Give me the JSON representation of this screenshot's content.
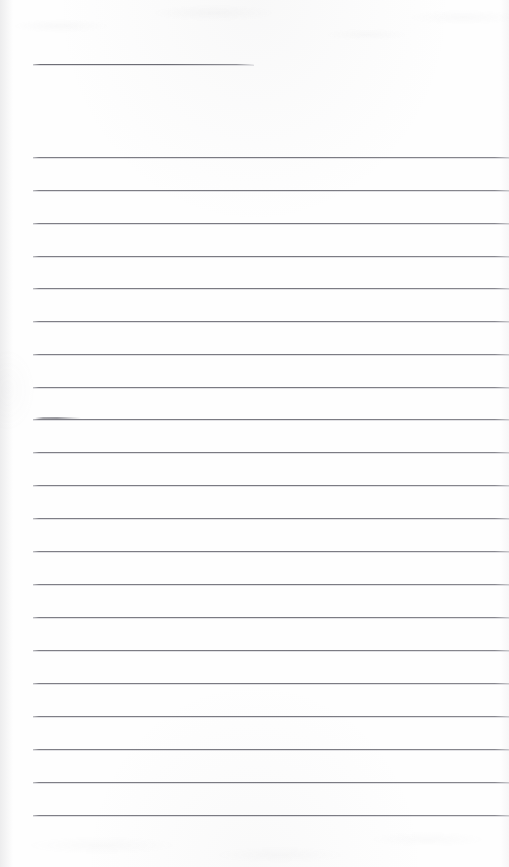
{
  "document": {
    "kind": "scanned-ruled-page",
    "description": "Blank lined writing paper, scanned",
    "page_width": 509,
    "page_height": 867,
    "paper_color": "#fefefe",
    "rule_color": "#787880",
    "edge_shadow_color": "#929298"
  },
  "layout": {
    "left_margin_x": 33,
    "right_edge_x": 509,
    "line_spacing": 32.9,
    "first_line_y": 157,
    "last_line_y": 815
  },
  "title_rule": {
    "label": "title-rule",
    "x": 33,
    "y": 64,
    "width": 221
  },
  "rules": [
    {
      "y": 157,
      "x": 33,
      "width": 476
    },
    {
      "y": 190,
      "x": 33,
      "width": 476
    },
    {
      "y": 223,
      "x": 33,
      "width": 476
    },
    {
      "y": 256,
      "x": 33,
      "width": 476
    },
    {
      "y": 288,
      "x": 33,
      "width": 476
    },
    {
      "y": 321,
      "x": 33,
      "width": 476
    },
    {
      "y": 354,
      "x": 33,
      "width": 476
    },
    {
      "y": 387,
      "x": 33,
      "width": 476
    },
    {
      "y": 419,
      "x": 33,
      "width": 476
    },
    {
      "y": 452,
      "x": 33,
      "width": 476
    },
    {
      "y": 485,
      "x": 33,
      "width": 476
    },
    {
      "y": 518,
      "x": 33,
      "width": 476
    },
    {
      "y": 551,
      "x": 33,
      "width": 476
    },
    {
      "y": 584,
      "x": 33,
      "width": 476
    },
    {
      "y": 617,
      "x": 33,
      "width": 476
    },
    {
      "y": 650,
      "x": 33,
      "width": 476
    },
    {
      "y": 683,
      "x": 33,
      "width": 476
    },
    {
      "y": 716,
      "x": 33,
      "width": 476
    },
    {
      "y": 749,
      "x": 33,
      "width": 476
    },
    {
      "y": 782,
      "x": 33,
      "width": 476
    },
    {
      "y": 815,
      "x": 33,
      "width": 476
    }
  ],
  "marks": [
    {
      "label": "ink-smudge",
      "x": 35,
      "y": 417,
      "width": 46,
      "on_rule_y": 419
    }
  ],
  "text": {
    "body": "",
    "note": "no handwriting or printed text present on the page"
  }
}
